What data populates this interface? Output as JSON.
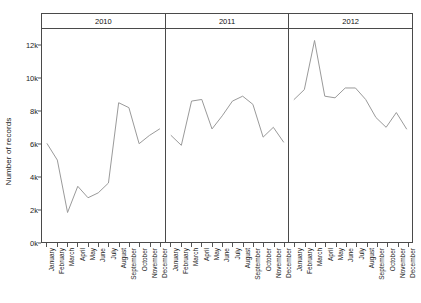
{
  "chart_data": {
    "type": "line",
    "title": "",
    "xlabel": "",
    "ylabel": "Number of records",
    "ylim": [
      0,
      13000
    ],
    "ytick_labels": [
      "0k",
      "2k",
      "4k",
      "6k",
      "8k",
      "10k",
      "12k"
    ],
    "ytick_values": [
      0,
      2000,
      4000,
      6000,
      8000,
      10000,
      12000
    ],
    "grid": false,
    "legend": "none",
    "line_color": "#9a9a9a",
    "panel_border_color": "#4a4a4a",
    "categories": [
      "January",
      "February",
      "March",
      "April",
      "May",
      "June",
      "July",
      "August",
      "September",
      "October",
      "November",
      "December"
    ],
    "panels": [
      {
        "label": "2010",
        "values": [
          6000,
          5000,
          1800,
          3400,
          2700,
          3000,
          3600,
          8500,
          8200,
          6000,
          6500,
          6900
        ]
      },
      {
        "label": "2011",
        "values": [
          6500,
          5900,
          8600,
          8700,
          6900,
          7700,
          8600,
          8900,
          8400,
          6400,
          7000,
          6100
        ]
      },
      {
        "label": "2012",
        "values": [
          8700,
          9300,
          12300,
          8900,
          8800,
          9400,
          9400,
          8700,
          7600,
          7000,
          7900,
          6900
        ]
      }
    ]
  }
}
